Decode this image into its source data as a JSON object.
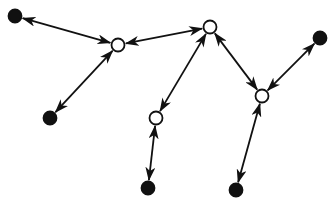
{
  "diagram": {
    "type": "network",
    "width": 335,
    "height": 205,
    "colors": {
      "stroke": "#111111",
      "filled": "#111111",
      "open": "#ffffff",
      "background": "#ffffff"
    },
    "nodes": [
      {
        "id": "leaf-top-left",
        "x": 15,
        "y": 16,
        "kind": "filled"
      },
      {
        "id": "leaf-left",
        "x": 50,
        "y": 118,
        "kind": "filled"
      },
      {
        "id": "hub-left",
        "x": 118,
        "y": 45,
        "kind": "open"
      },
      {
        "id": "hub-top",
        "x": 210,
        "y": 27,
        "kind": "open"
      },
      {
        "id": "hub-middle",
        "x": 156,
        "y": 118,
        "kind": "open"
      },
      {
        "id": "hub-right",
        "x": 262,
        "y": 96,
        "kind": "open"
      },
      {
        "id": "leaf-right",
        "x": 320,
        "y": 38,
        "kind": "filled"
      },
      {
        "id": "leaf-bottom-middle",
        "x": 148,
        "y": 188,
        "kind": "filled"
      },
      {
        "id": "leaf-bottom-right",
        "x": 236,
        "y": 190,
        "kind": "filled"
      }
    ],
    "edges": [
      {
        "from": "leaf-top-left",
        "to": "hub-left",
        "direction": "both"
      },
      {
        "from": "leaf-left",
        "to": "hub-left",
        "direction": "both"
      },
      {
        "from": "hub-left",
        "to": "hub-top",
        "direction": "both"
      },
      {
        "from": "hub-top",
        "to": "hub-middle",
        "direction": "both"
      },
      {
        "from": "hub-middle",
        "to": "leaf-bottom-middle",
        "direction": "both"
      },
      {
        "from": "hub-top",
        "to": "hub-right",
        "direction": "both"
      },
      {
        "from": "hub-right",
        "to": "leaf-right",
        "direction": "both"
      },
      {
        "from": "hub-right",
        "to": "leaf-bottom-right",
        "direction": "both"
      }
    ]
  }
}
